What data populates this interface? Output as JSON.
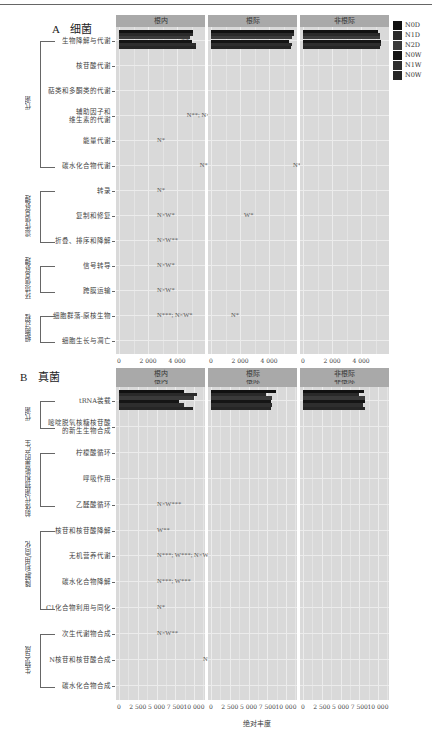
{
  "legend": {
    "items": [
      {
        "label": "N0D",
        "color": "#111111"
      },
      {
        "label": "N1D",
        "color": "#2a2a2a"
      },
      {
        "label": "N2D",
        "color": "#3a3a3a"
      },
      {
        "label": "N0W",
        "color": "#151515"
      },
      {
        "label": "N1W",
        "color": "#2e2e2e"
      },
      {
        "label": "N0W",
        "color": "#262626"
      }
    ]
  },
  "panel_a": {
    "letter": "A",
    "title": "细菌",
    "strips": [
      "根内",
      "根际",
      "非根际"
    ],
    "ticks": [
      "0",
      "2 000",
      "4 000"
    ]
  },
  "panel_b": {
    "letter": "B",
    "title": "真菌",
    "strips": [
      "根内",
      "根际",
      "非根际"
    ],
    "ticks": [
      "0",
      "2 500",
      "5 000",
      "7 500",
      "10 000"
    ],
    "xlabel": "绝对丰度"
  },
  "chart_data": [
    {
      "type": "bar",
      "orientation": "horizontal",
      "title": "A 细菌",
      "xlabel": "",
      "xlim": [
        0,
        5700
      ],
      "facets": [
        "根内",
        "根际",
        "非根际"
      ],
      "series_names": [
        "N0D",
        "N1D",
        "N2D",
        "N0W",
        "N1W",
        "N0W"
      ],
      "groups": [
        {
          "name": "代谢",
          "categories": [
            "生物降解与代谢",
            "核苷酸代谢",
            "萜类和多酮类的代谢",
            "辅助因子和维生素的代谢",
            "能量代谢",
            "碳水化合物代谢"
          ]
        },
        {
          "name": "遗传信息处理",
          "categories": [
            "转录",
            "复制和修复",
            "折叠、排序和降解"
          ]
        },
        {
          "name": "环境信息处理",
          "categories": [
            "信号转导",
            "跨膜运输"
          ]
        },
        {
          "name": "细胞过程",
          "categories": [
            "细胞群落-原核生物",
            "细胞生长与凋亡"
          ]
        }
      ],
      "categories": [
        "生物降解与代谢",
        "核苷酸代谢",
        "萜类和多酮类的代谢",
        "辅助因子和维生素的代谢",
        "能量代谢",
        "碳水化合物代谢",
        "转录",
        "复制和修复",
        "折叠、排序和降解",
        "信号转导",
        "跨膜运输",
        "细胞群落-原核生物",
        "细胞生长与凋亡"
      ],
      "values": {
        "根内": [
          [
            3200,
            3700,
            2900,
            2900,
            4000,
            3300
          ],
          [
            500,
            500,
            500,
            500,
            500,
            500
          ],
          [
            3000,
            3200,
            2600,
            3000,
            3100,
            3100
          ],
          [
            4300,
            4400,
            3700,
            4100,
            4200,
            3800
          ],
          [
            2000,
            2000,
            1800,
            1800,
            1900,
            1900
          ],
          [
            5100,
            5100,
            4900,
            5000,
            5300,
            5300
          ],
          [
            300,
            200,
            200,
            200,
            200,
            300
          ],
          [
            1600,
            1700,
            1400,
            1600,
            1700,
            1700
          ],
          [
            1000,
            1000,
            900,
            1000,
            1000,
            1000
          ],
          [
            250,
            250,
            200,
            250,
            250,
            250
          ],
          [
            900,
            1000,
            900,
            900,
            1000,
            1000
          ],
          [
            40,
            40,
            40,
            40,
            40,
            40
          ],
          [
            600,
            600,
            500,
            400,
            600,
            600
          ]
        ],
        "根际": [
          [
            2600,
            3100,
            2200,
            2800,
            2300,
            2500
          ],
          [
            600,
            600,
            600,
            600,
            600,
            600
          ],
          [
            3600,
            3700,
            3400,
            3500,
            3300,
            3400
          ],
          [
            4600,
            4600,
            4600,
            4600,
            4600,
            4600
          ],
          [
            2000,
            2000,
            2000,
            1900,
            2000,
            2000
          ],
          [
            5700,
            5700,
            5600,
            5400,
            5600,
            5500
          ],
          [
            300,
            300,
            300,
            300,
            300,
            300
          ],
          [
            2000,
            2000,
            2000,
            1900,
            1900,
            1900
          ],
          [
            1200,
            1200,
            1200,
            1200,
            1200,
            1200
          ],
          [
            200,
            200,
            200,
            200,
            200,
            200
          ],
          [
            800,
            800,
            700,
            800,
            800,
            800
          ],
          [
            40,
            40,
            40,
            40,
            40,
            40
          ],
          [
            500,
            500,
            500,
            400,
            500,
            500
          ]
        ],
        "非根际": [
          [
            2700,
            2800,
            2700,
            2800,
            2700,
            2500
          ],
          [
            600,
            600,
            600,
            600,
            600,
            600
          ],
          [
            3700,
            3800,
            3700,
            3800,
            3800,
            3800
          ],
          [
            4700,
            4700,
            4700,
            4700,
            4700,
            4700
          ],
          [
            2100,
            2100,
            2100,
            2100,
            2100,
            2100
          ],
          [
            5200,
            5300,
            5300,
            5400,
            5400,
            5300
          ],
          [
            300,
            300,
            300,
            300,
            300,
            300
          ],
          [
            2000,
            2000,
            2000,
            2000,
            2100,
            2100
          ],
          [
            1200,
            1200,
            1200,
            1200,
            1200,
            1200
          ],
          [
            200,
            200,
            200,
            200,
            200,
            200
          ],
          [
            700,
            700,
            700,
            700,
            700,
            700
          ],
          [
            40,
            40,
            40,
            40,
            40,
            40
          ],
          [
            500,
            500,
            500,
            500,
            500,
            500
          ]
        ]
      },
      "annotations": {
        "根内": [
          "N*",
          "",
          "",
          "N**; N×W**",
          "N*",
          "N*",
          "N*",
          "N×W*",
          "N×W**",
          "N×W*",
          "N×W*",
          "N***; N×W*",
          ""
        ],
        "根际": [
          "",
          "",
          "",
          "",
          "",
          "N*",
          "",
          "W*",
          "",
          "",
          "",
          "N*",
          ""
        ],
        "非根际": [
          "",
          "",
          "",
          "",
          "",
          "",
          "",
          "",
          "",
          "",
          "",
          "",
          ""
        ]
      }
    },
    {
      "type": "bar",
      "orientation": "horizontal",
      "title": "B 真菌",
      "xlabel": "绝对丰度",
      "xlim": [
        0,
        11000
      ],
      "facets": [
        "根内",
        "根际",
        "非根际"
      ],
      "series_names": [
        "N0D",
        "N1D",
        "N2D",
        "N0W",
        "N1W",
        "N0W"
      ],
      "groups": [
        {
          "name": "代谢",
          "categories": [
            "tRNA装载",
            "嘧啶脱氧核糖核苷酸的新生生物合成"
          ]
        },
        {
          "name": "前体代谢物和能量的产生",
          "categories": [
            "柠檬酸循环",
            "呼吸作用",
            "乙醛酸循环"
          ]
        },
        {
          "name": "降解/利用/同化",
          "categories": [
            "核苷和核苷酸降解",
            "无机营养代谢",
            "碳水化合物降解",
            "C1化合物利用与同化"
          ]
        },
        {
          "name": "生物合成",
          "categories": [
            "次生代谢物合成",
            "N核苷和核苷酸合成",
            "碳水化合物合成"
          ]
        }
      ],
      "categories": [
        "tRNA装载",
        "嘧啶脱氧核糖核苷酸的新生生物合成",
        "柠檬酸循环",
        "呼吸作用",
        "乙醛酸循环",
        "核苷和核苷酸降解",
        "无机营养代谢",
        "碳水化合物降解",
        "C1化合物利用与同化",
        "次生代谢物合成",
        "N核苷和核苷酸合成",
        "碳水化合物合成"
      ],
      "values": {
        "根内": [
          [
            800,
            1000,
            1000,
            900,
            1000,
            1100
          ],
          [
            800,
            1000,
            1000,
            800,
            500,
            1300
          ],
          [
            1000,
            1000,
            1000,
            1000,
            1000,
            1000
          ],
          [
            5500,
            6300,
            5000,
            5400,
            5200,
            800
          ],
          [
            1100,
            1200,
            1300,
            1300,
            1200,
            1100
          ],
          [
            1000,
            1000,
            1000,
            1000,
            1000,
            400
          ],
          [
            700,
            1200,
            800,
            500,
            400,
            1700
          ],
          [
            900,
            1900,
            2000,
            1800,
            1700,
            3700
          ],
          [
            700,
            700,
            700,
            600,
            700,
            1000
          ],
          [
            1500,
            1700,
            2000,
            1500,
            1300,
            1000
          ],
          [
            8700,
            10400,
            10000,
            8000,
            8700,
            9900
          ],
          [
            2100,
            2700,
            3100,
            2700,
            2700,
            2800
          ]
        ],
        "根际": [
          [
            1000,
            1000,
            1000,
            1000,
            1000,
            1000
          ],
          [
            700,
            700,
            700,
            700,
            700,
            700
          ],
          [
            1000,
            1000,
            1000,
            1000,
            1000,
            1000
          ],
          [
            5800,
            5800,
            5600,
            6000,
            5800,
            5700
          ],
          [
            1300,
            1300,
            1300,
            1300,
            1300,
            1300
          ],
          [
            1100,
            1200,
            1200,
            1200,
            1100,
            1100
          ],
          [
            700,
            800,
            800,
            700,
            700,
            700
          ],
          [
            1500,
            1800,
            1700,
            1800,
            1700,
            1500
          ],
          [
            600,
            600,
            600,
            600,
            600,
            600
          ],
          [
            1800,
            1800,
            1800,
            1800,
            1800,
            1800
          ],
          [
            8600,
            7300,
            8100,
            8000,
            8100,
            8000
          ],
          [
            2800,
            3000,
            3000,
            2900,
            2900,
            2900
          ]
        ],
        "非根际": [
          [
            1000,
            1000,
            1000,
            1000,
            1000,
            1000
          ],
          [
            800,
            700,
            800,
            700,
            700,
            800
          ],
          [
            1000,
            1000,
            1000,
            1000,
            1000,
            1000
          ],
          [
            5900,
            5800,
            5100,
            5900,
            5900,
            5000
          ],
          [
            1300,
            1300,
            1300,
            1300,
            1300,
            1300
          ],
          [
            1100,
            1200,
            1100,
            1100,
            1200,
            1000
          ],
          [
            900,
            900,
            900,
            800,
            800,
            900
          ],
          [
            1900,
            1900,
            1900,
            1300,
            1400,
            2000
          ],
          [
            600,
            600,
            600,
            600,
            600,
            600
          ],
          [
            1900,
            1800,
            1800,
            1800,
            1800,
            1800
          ],
          [
            8100,
            7500,
            8300,
            8200,
            8000,
            8300
          ],
          [
            3200,
            3200,
            3100,
            3100,
            3100,
            3200
          ]
        ]
      },
      "annotations": {
        "根内": [
          "",
          "",
          "",
          "",
          "N×W***",
          "W**",
          "N***; W***; N×W***",
          "N***; W***",
          "N*",
          "N×W**",
          "N**",
          ""
        ],
        "根际": [
          "",
          "",
          "",
          "",
          "",
          "",
          "",
          "",
          "",
          "",
          "",
          ""
        ],
        "非根际": [
          "",
          "",
          "",
          "",
          "",
          "",
          "",
          "",
          "",
          "",
          "",
          ""
        ]
      }
    }
  ]
}
